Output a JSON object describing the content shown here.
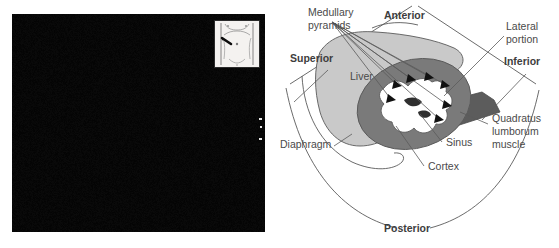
{
  "figure": {
    "kind": "medical-ultrasound-with-anatomic-diagram",
    "region": "right upper quadrant / right kidney longitudinal view"
  },
  "ultrasound": {
    "name": "ultrasound-image",
    "modality_appearance": "grayscale B-mode sector scan",
    "inset": {
      "name": "body-position-inset",
      "description": "supine body outline with transducer placement marker"
    }
  },
  "diagram": {
    "orientation_labels": [
      {
        "id": "superior",
        "text": "Superior",
        "x": 22,
        "y": 62
      },
      {
        "id": "anterior",
        "text": "Anterior",
        "x": 116,
        "y": 19
      },
      {
        "id": "inferior",
        "text": "Inferior",
        "x": 236,
        "y": 65
      },
      {
        "id": "posterior",
        "text": "Posterior",
        "x": 116,
        "y": 232
      }
    ],
    "structure_labels": [
      {
        "id": "medullary-pyramids",
        "lines": [
          "Medullary",
          "pyramids"
        ],
        "x": 40,
        "y": 16
      },
      {
        "id": "lateral-portion",
        "lines": [
          "Lateral",
          "portion"
        ],
        "x": 238,
        "y": 30
      },
      {
        "id": "liver",
        "lines": [
          "Liver"
        ],
        "x": 82,
        "y": 80
      },
      {
        "id": "quadratus-lumborum",
        "lines": [
          "Quadratus",
          "lumborum",
          "muscle"
        ],
        "x": 224,
        "y": 122
      },
      {
        "id": "diaphragm",
        "lines": [
          "Diaphragm"
        ],
        "x": 12,
        "y": 148
      },
      {
        "id": "sinus",
        "lines": [
          "Sinus"
        ],
        "x": 178,
        "y": 146
      },
      {
        "id": "cortex",
        "lines": [
          "Cortex"
        ],
        "x": 160,
        "y": 170
      }
    ],
    "colors": {
      "liver_fill": "#c9c9c9",
      "cortex_fill": "#7a7a7a",
      "sinus_fill": "#ffffff",
      "muscle_fill": "#5c5c5c",
      "outline": "#5a5a5a",
      "label_text": "#4a4a4a",
      "arrowhead": "#111111"
    }
  }
}
